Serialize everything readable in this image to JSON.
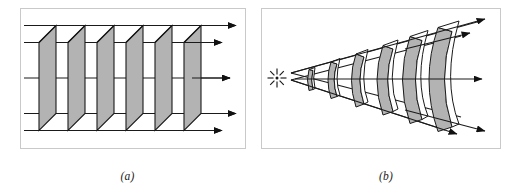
{
  "figure": {
    "background_color": "#ffffff",
    "panels": [
      {
        "id": "a",
        "caption": "(a)",
        "description": "Plane wavefronts propagating as parallel flat planes with parallel rays",
        "wavefront_type": "plane",
        "wavefront_count": 6,
        "ray_count": 5,
        "source": "none",
        "fill_color": "#b3b3b3",
        "line_color": "#1a1a1a",
        "frame_color": "#c8c8c8"
      },
      {
        "id": "b",
        "caption": "(b)",
        "description": "Spherical wavefronts expanding from a point source within a diverging cone, with radial rays",
        "wavefront_type": "spherical",
        "wavefront_count": 6,
        "ray_count": 5,
        "source": "point-source",
        "source_icon": "starburst-icon",
        "source_spokes": 8,
        "fill_color": "#b3b3b3",
        "line_color": "#1a1a1a",
        "frame_color": "#c8c8c8"
      }
    ]
  }
}
